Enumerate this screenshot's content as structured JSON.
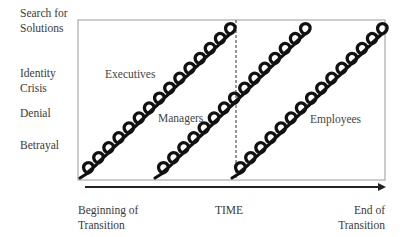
{
  "diagram": {
    "y_axis_stages": [
      {
        "label": "Search for\nSolutions",
        "line1": "Search for",
        "line2": "Solutions"
      },
      {
        "label": "Identity\nCrisis",
        "line1": "Identity",
        "line2": "Crisis"
      },
      {
        "label": "Denial",
        "line1": "Denial",
        "line2": ""
      },
      {
        "label": "Betrayal",
        "line1": "Betrayal",
        "line2": ""
      }
    ],
    "x_axis": {
      "start_line1": "Beginning of",
      "start_line2": "Transition",
      "center": "TIME",
      "end_line1": "End of",
      "end_line2": "Transition"
    },
    "groups": [
      {
        "name": "Executives"
      },
      {
        "name": "Managers"
      },
      {
        "name": "Employees"
      }
    ],
    "colors": {
      "spiral": "#111111",
      "frame": "#888888",
      "arrow": "#222222"
    }
  }
}
